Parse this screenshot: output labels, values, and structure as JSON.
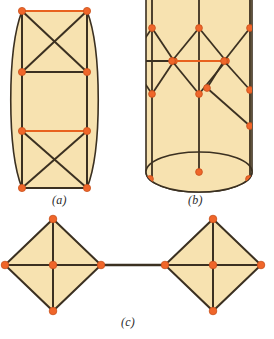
{
  "figure": {
    "title": "",
    "background_color": "#ffffff",
    "fill_color": "#f7e2b0",
    "line_color": "#3b3021",
    "vertex_color": "#f0662a",
    "vertex_edge_color": "#c8501c",
    "highlight_edge_color": "#e8621f",
    "label_color": "#2b2b2b",
    "panels": [
      {
        "id": "a",
        "label": "(a)",
        "label_x": 52,
        "label_y": 193,
        "shape": "lens-barrel-with-braced-cells",
        "vertex_count": 8,
        "cell_count": 3,
        "braced_cells": [
          1,
          3
        ],
        "outline": {
          "top_y": 11,
          "bottom_y": 188,
          "left_x": 22,
          "right_x": 87,
          "bulge_left_x": 7,
          "bulge_right_x": 102
        },
        "rows_y": [
          11,
          72,
          131,
          188
        ],
        "vertices": [
          {
            "x": 22,
            "y": 11
          },
          {
            "x": 87,
            "y": 11
          },
          {
            "x": 22,
            "y": 72
          },
          {
            "x": 87,
            "y": 72
          },
          {
            "x": 22,
            "y": 131
          },
          {
            "x": 87,
            "y": 131
          },
          {
            "x": 22,
            "y": 188
          },
          {
            "x": 87,
            "y": 188
          }
        ]
      },
      {
        "id": "b",
        "label": "(b)",
        "label_x": 188,
        "label_y": 193,
        "shape": "cylinder-with-pendant-diamonds",
        "cylinder": {
          "left_x": 146,
          "right_x": 252,
          "top_y": 0,
          "base_center_y": 172,
          "base_rx": 53,
          "base_ry": 20
        },
        "diamonds": [
          {
            "name": "left-diamond",
            "cx": 152,
            "cy": 61,
            "rx": 22,
            "ry": 33,
            "clipped": true
          },
          {
            "name": "middle-diamond",
            "cx": 199,
            "cy": 61,
            "rx": 27,
            "ry": 33,
            "clipped": false
          },
          {
            "name": "right-split-diamond",
            "cx": 250,
            "cy": 61,
            "rx": 28,
            "ry": 33,
            "clipped": true
          }
        ],
        "vertex_count": 14
      },
      {
        "id": "c",
        "label": "(c)",
        "label_x": 121,
        "label_y": 315,
        "shape": "two-crossed-diamonds-joined-by-bar",
        "diamonds": [
          {
            "name": "left-diamond",
            "cx": 53,
            "cy": 265,
            "rx": 48,
            "ry": 46
          },
          {
            "name": "right-diamond",
            "cx": 213,
            "cy": 265,
            "rx": 48,
            "ry": 46
          }
        ],
        "connector": {
          "x1": 101,
          "y1": 265,
          "x2": 165,
          "y2": 265
        },
        "vertex_count": 12
      }
    ]
  }
}
